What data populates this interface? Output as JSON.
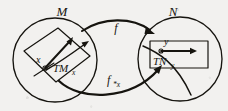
{
  "figure": {
    "caption_absent": true,
    "background_color": "#f2f1ef",
    "ink_color": "#16140f"
  },
  "domains": {
    "source": {
      "name": "source-manifold",
      "label": "M",
      "shape": "circle",
      "cx": 55,
      "cy": 60,
      "r": 42
    },
    "target": {
      "name": "target-manifold",
      "label": "N",
      "shape": "circle",
      "cx": 180,
      "cy": 59,
      "r": 42
    }
  },
  "tangent_spaces": {
    "source": {
      "label": "TM",
      "subscript": "x",
      "full_label": "TM_x",
      "shape": "tilted parallelogram",
      "base_point_label": "x",
      "base_point": {
        "x": 45,
        "y": 68
      }
    },
    "target": {
      "label": "TN",
      "subscript": "y",
      "full_label": "TN_y",
      "shape": "axis aligned rectangle",
      "base_point_label": "y",
      "base_point": {
        "x": 161,
        "y": 51
      }
    }
  },
  "maps": {
    "top": {
      "label": "f",
      "name": "map-f",
      "direction": "M to N",
      "style": "curved arrow above"
    },
    "bottom": {
      "label": "f",
      "subscript": "*x",
      "full_label": "f*x",
      "name": "map-f-pushforward",
      "direction": "TM_x to TN_y",
      "style": "curved arrow below"
    }
  },
  "vectors": {
    "source_tangent_vector": {
      "name": "tangent-vector-at-x",
      "direction": "up-right"
    },
    "target_tangent_vector": {
      "name": "tangent-vector-at-y",
      "direction": "right horizontal"
    }
  }
}
